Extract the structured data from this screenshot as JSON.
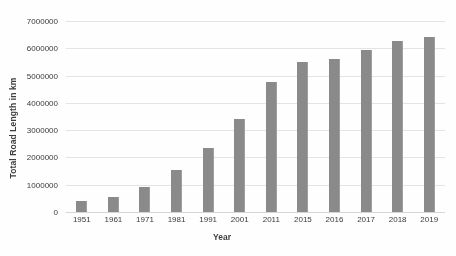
{
  "chart_data": {
    "type": "bar",
    "title": "",
    "xlabel": "Year",
    "ylabel": "Total Road Length in km",
    "categories": [
      "1951",
      "1961",
      "1971",
      "1981",
      "1991",
      "2001",
      "2011",
      "2015",
      "2016",
      "2017",
      "2018",
      "2019"
    ],
    "values": [
      400000,
      540000,
      930000,
      1530000,
      2330000,
      3400000,
      4770000,
      5500000,
      5620000,
      5950000,
      6250000,
      6400000
    ],
    "ylim": [
      0,
      7000000
    ],
    "ytick_labels": [
      "7000000",
      "6000000",
      "5000000",
      "4000000",
      "3000000",
      "2000000",
      "1000000",
      "0"
    ],
    "ytick_values": [
      7000000,
      6000000,
      5000000,
      4000000,
      3000000,
      2000000,
      1000000,
      0
    ],
    "ytick_step": 1000000,
    "grid": true,
    "legend": false,
    "legend_position": "none",
    "series_name": "Total Road Length in km",
    "bar_color": "#8a8a8a",
    "gridline_color": "#e4e4e4",
    "background_color": "#ffffff",
    "text_color": "#3b3b3b"
  }
}
